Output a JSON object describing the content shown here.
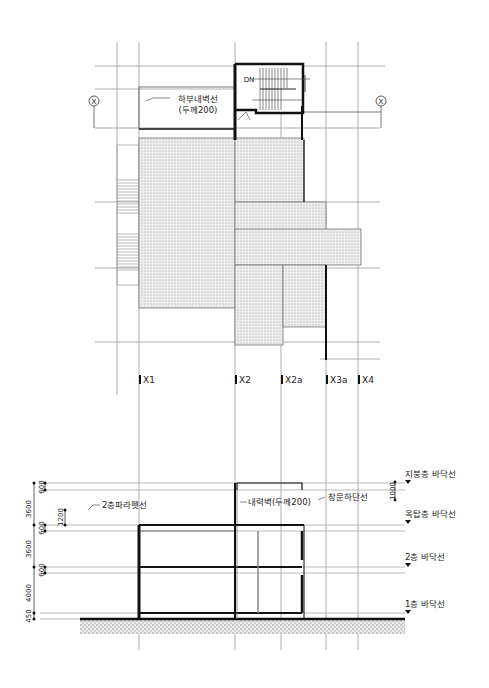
{
  "plan": {
    "title": "Floor plan (rooftop / stair tower)",
    "grid_marker_left": "X",
    "grid_marker_right": "X",
    "wall_note_line1": "하부내벽선",
    "wall_note_line2": "(두께200)",
    "stair_label": "DN",
    "grid_labels": [
      "X1",
      "X2",
      "X2a",
      "X3a",
      "X4"
    ]
  },
  "section": {
    "title": "Section",
    "level_labels": {
      "roof": "지붕층 바닥선",
      "penthouse": "옥탑층 바닥선",
      "second": "2층 바닥선",
      "first": "1층 바닥선"
    },
    "notes": {
      "parapet": "2층파라펫선",
      "bearing_wall": "내력벽(두께200)",
      "window_sill": "창문하단선"
    },
    "dimensions": {
      "top_dim_a": "3600",
      "top_dim_b": "3600",
      "lower_dim": "4000",
      "base_dim": "450",
      "slab_600_a": "600",
      "slab_600_b": "600",
      "slab_600_c": "600",
      "parapet_dim": "1200",
      "sill_dim": "1000"
    }
  },
  "colors": {
    "line": "#222222",
    "thin": "#9a9a9a",
    "hatch": "#d8d8d8"
  }
}
